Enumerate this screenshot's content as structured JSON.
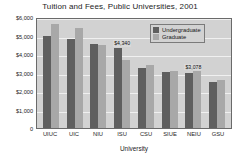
{
  "chart_data": {
    "type": "bar",
    "title": "Tuition and Fees, Public Universities, 2001",
    "xlabel": "University",
    "ylabel": "",
    "ylim": [
      0,
      6000
    ],
    "ytick_labels": [
      "$6,000",
      "$5,000",
      "$4,000",
      "$3,000",
      "$2,000",
      "$1,000",
      "0"
    ],
    "ytick_values": [
      6000,
      5000,
      4000,
      3000,
      2000,
      1000,
      0
    ],
    "grid": true,
    "legend_position": "top-right",
    "categories": [
      "UIUC",
      "UIC",
      "NIU",
      "ISU",
      "CSU",
      "SIUE",
      "NEIU",
      "GSU"
    ],
    "series": [
      {
        "name": "Undergraduate",
        "color": "#5f5f5f",
        "values": [
          5000,
          4800,
          4560,
          4340,
          3270,
          3010,
          2960,
          2470
        ]
      },
      {
        "name": "Graduate",
        "color": "#a8a8a8",
        "values": [
          5600,
          5430,
          4500,
          3670,
          3390,
          3090,
          3078,
          2590
        ]
      }
    ],
    "annotations": [
      {
        "text": "$4,340",
        "category": "ISU",
        "series": "Undergraduate",
        "value": 4340
      },
      {
        "text": "$3,078",
        "category": "NEIU",
        "series": "Graduate",
        "value": 3078
      }
    ]
  },
  "legend": {
    "entries": [
      {
        "label": "Undergraduate"
      },
      {
        "label": "Graduate"
      }
    ]
  }
}
